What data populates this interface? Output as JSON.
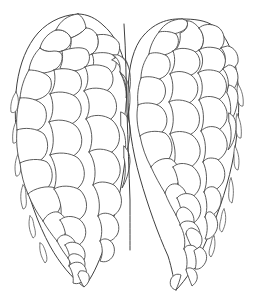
{
  "figure": {
    "style": "ink contour line art",
    "background_color": "#ffffff",
    "line_color": "#4a4a4a",
    "outline_color": "#3f3f3f",
    "fill_color": "#ffffff",
    "line_width": 0.9,
    "canvas": {
      "width": 260,
      "height": 300
    }
  },
  "composition": {
    "lobe_count": 2,
    "arrangement": "side-by-side twin lobes joined along a vertical central cleft",
    "lobes": [
      {
        "id": "left-lobe",
        "name": "left cone lobe",
        "bounds": {
          "x": 14,
          "y": 13,
          "width": 118,
          "height": 275
        },
        "apex": {
          "x": 78,
          "y": 14
        },
        "tip": {
          "x": 84,
          "y": 287
        },
        "scale_rows": 13,
        "scale_size_top": 30,
        "scale_size_bottom": 11
      },
      {
        "id": "right-lobe",
        "name": "right cone lobe",
        "bounds": {
          "x": 126,
          "y": 18,
          "width": 118,
          "height": 275
        },
        "apex": {
          "x": 182,
          "y": 19
        },
        "tip": {
          "x": 176,
          "y": 290
        },
        "scale_rows": 13,
        "scale_size_top": 30,
        "scale_size_bottom": 11
      }
    ],
    "cleft": {
      "name": "central cleft",
      "top": {
        "x": 124,
        "y": 24
      },
      "bottom": {
        "x": 130,
        "y": 250
      },
      "notch_depth": 60
    }
  },
  "chart_data": {
    "type": "line",
    "xlabel": "",
    "ylabel": "",
    "grid": false,
    "legend": "none",
    "xlim": [
      0,
      260
    ],
    "ylim": [
      0,
      300
    ],
    "series": [
      {
        "name": "left-lobe-outline",
        "points": "M 78 14 C 60 15 44 24 34 38 C 24 52 18 70 16 92 C 14 116 16 142 22 168 C 28 196 38 224 50 246 C 60 264 72 278 84 287 C 92 278 98 264 104 248 C 112 226 120 198 124 168 C 128 140 130 112 128 86 C 126 60 118 38 104 26 C 96 18 87 14 78 14 Z"
      },
      {
        "name": "right-lobe-outline",
        "points": "M 182 19 C 164 18 150 26 140 40 C 131 54 128 74 128 96 C 128 122 132 150 140 178 C 148 206 158 234 168 256 C 172 268 174 282 176 290 C 186 280 196 264 204 246 C 216 220 226 192 232 164 C 238 136 240 108 238 84 C 236 58 228 36 214 26 C 205 20 194 19 182 19 Z"
      },
      {
        "name": "central-cleft",
        "points": "M 124 24 C 126 52 126 82 127 112 C 128 142 129 172 130 200 C 130 222 130 238 130 250"
      }
    ]
  },
  "geometry": {
    "left_lobe_scales": [
      "M 56 30 C 48 33 42 40 40 48 C 45 52 54 53 62 51 C 68 49 72 44 71 38 C 68 32 62 29 56 30 Z",
      "M 78 14 C 68 15 60 21 56 30 C 62 29 68 32 71 38 C 76 36 82 33 86 28 C 85 21 82 16 78 14 Z",
      "M 86 28 C 82 33 76 36 71 38 C 72 44 70 50 66 55 C 74 58 84 58 92 54 C 98 50 100 42 97 35 C 94 30 90 28 86 28 Z",
      "M 97 35 C 100 42 98 50 92 54 C 96 60 104 62 112 60 C 118 57 121 50 119 43 C 115 36 106 33 97 35 Z",
      "M 40 48 C 34 54 30 62 29 70 C 36 74 46 74 54 70 C 60 67 63 61 62 55 C 61 52 58 51 54 51 C 48 52 43 51 40 48 Z",
      "M 62 51 C 63 55 63 62 60 68 C 68 72 78 72 85 67 C 90 63 91 55 87 50 C 82 46 70 48 62 51 Z",
      "M 92 54 C 95 60 94 68 89 73 C 96 77 105 77 111 73 C 117 69 118 60 113 55 C 108 52 99 52 92 54 Z",
      "M 112 60 C 118 62 122 68 121 75 C 126 76 128 72 128 66 C 127 59 122 56 117 57 Z",
      "M 29 70 C 24 78 21 88 20 98 C 27 102 38 101 45 96 C 51 92 53 84 50 78 C 45 72 36 70 29 70 Z",
      "M 54 70 C 56 78 55 88 50 94 C 58 99 70 99 77 93 C 83 88 83 78 77 72 C 70 68 60 68 54 70 Z",
      "M 85 67 C 89 74 89 84 84 91 C 92 96 103 95 109 89 C 115 83 114 73 108 68 C 101 64 91 64 85 67 Z",
      "M 113 55 C 118 58 121 64 120 72 C 124 80 127 90 126 98 C 130 94 131 84 130 74 C 129 64 124 57 118 55 Z",
      "M 20 98 C 17 108 16 120 17 130 C 24 134 34 133 41 128 C 47 123 48 113 44 106 C 38 99 27 97 20 98 Z",
      "M 50 94 C 54 102 54 114 49 122 C 57 128 69 127 76 121 C 83 115 83 104 76 97 C 68 91 56 91 50 94 Z",
      "M 84 91 C 90 98 91 110 86 119 C 95 125 107 124 113 117 C 119 110 117 98 110 92 C 102 87 90 87 84 91 Z",
      "M 120 72 C 126 80 128 92 126 104 C 126 112 124 120 121 126 C 127 122 130 110 130 98 C 130 86 127 77 120 72 Z",
      "M 17 130 C 16 141 17 153 20 163 C 27 166 37 164 43 158 C 49 152 49 141 44 134 C 37 128 24 127 17 130 Z",
      "M 49 122 C 54 131 55 145 50 155 C 58 161 70 160 77 153 C 84 146 83 133 76 126 C 68 119 56 119 49 122 Z",
      "M 86 119 C 92 127 94 141 89 152 C 98 158 110 156 116 148 C 122 140 120 127 112 120 C 104 114 92 114 86 119 Z",
      "M 121 126 C 126 134 127 146 124 158 C 127 152 130 141 130 130 C 130 120 127 114 121 112 Z",
      "M 20 163 C 21 174 24 185 28 194 C 35 195 44 192 49 186 C 54 179 53 168 47 162 C 40 158 27 159 20 163 Z",
      "M 50 155 C 56 164 58 178 54 189 C 62 195 74 193 80 186 C 87 178 85 165 78 158 C 70 152 57 152 50 155 Z",
      "M 89 152 C 95 160 97 174 93 185 C 101 190 112 188 117 180 C 123 172 120 160 113 153 C 105 148 95 148 89 152 Z",
      "M 124 158 C 126 166 126 178 122 188 C 126 182 129 172 130 162 C 130 154 128 150 124 146 Z",
      "M 28 194 C 32 204 37 213 43 221 C 49 220 56 216 59 210 C 63 203 61 193 55 188 C 48 185 34 188 28 194 Z",
      "M 54 189 C 60 197 63 210 60 220 C 67 225 77 223 83 216 C 89 209 87 197 80 190 C 72 185 60 185 54 189 Z",
      "M 93 185 C 99 193 101 206 98 216 C 105 220 115 217 119 210 C 124 202 121 191 114 185 C 106 181 98 181 93 185 Z",
      "M 43 221 C 47 228 52 235 57 241 C 62 239 66 234 67 228 C 68 221 64 215 58 212 C 52 211 46 215 43 221 Z",
      "M 60 220 C 65 227 67 237 65 245 C 71 249 79 247 83 241 C 88 234 86 224 79 219 C 72 215 64 216 60 220 Z",
      "M 98 216 C 102 223 103 233 100 241 C 106 244 113 241 117 235 C 121 228 118 219 112 215 C 106 212 101 213 98 216 Z",
      "M 57 241 C 60 247 64 253 68 258 C 72 256 75 252 76 247 C 76 241 72 237 67 235 C 62 234 58 237 57 241 Z",
      "M 65 245 C 69 251 71 259 69 266 C 74 269 80 267 83 262 C 87 256 85 248 79 244 C 73 241 68 242 65 245 Z",
      "M 100 241 C 103 247 103 255 100 261 C 105 263 110 261 113 256 C 116 250 114 243 109 240 C 105 238 102 239 100 241 Z",
      "M 68 258 C 71 264 74 270 78 275 C 82 273 85 269 85 264 C 85 259 81 255 76 254 C 72 253 69 255 68 258 Z",
      "M 69 266 C 72 271 74 277 73 283 C 78 285 83 282 85 278 C 88 272 86 266 81 263 C 76 261 71 263 69 266 Z",
      "M 78 275 C 80 280 82 284 84 287 C 88 284 90 280 89 276 C 88 272 84 270 80 271 Z"
    ],
    "right_lobe_scales": [
      "M 182 19 C 172 19 164 24 159 32 C 165 35 173 35 180 32 C 186 30 189 25 187 21 Z",
      "M 159 32 C 154 38 150 46 149 54 C 156 57 166 56 173 51 C 179 47 180 39 176 34 C 170 31 163 31 159 32 Z",
      "M 187 21 C 189 26 186 31 180 33 C 181 40 179 47 174 52 C 182 56 192 55 199 50 C 205 45 205 35 199 28 C 195 23 190 20 187 21 Z",
      "M 199 28 C 205 35 205 45 199 51 C 206 55 215 54 221 48 C 226 42 225 32 218 27 C 211 23 203 24 199 28 Z",
      "M 149 54 C 144 61 141 70 141 78 C 148 82 158 81 165 76 C 171 71 172 62 167 56 C 160 52 153 52 149 54 Z",
      "M 173 51 C 176 58 175 68 170 74 C 178 79 189 78 196 72 C 202 66 201 56 194 51 C 186 47 177 48 173 51 Z",
      "M 199 50 C 204 56 204 66 198 73 C 206 78 216 76 222 70 C 228 64 226 54 219 49 C 211 46 203 47 199 50 Z",
      "M 221 48 C 226 53 227 62 223 69 C 230 71 236 68 238 62 C 239 54 234 47 228 46 Z",
      "M 141 78 C 138 86 137 96 138 105 C 145 109 155 107 161 102 C 167 96 167 86 161 80 C 154 76 145 76 141 78 Z",
      "M 170 74 C 174 82 174 94 169 102 C 177 108 188 106 194 99 C 200 92 199 81 191 75 C 183 70 174 71 170 74 Z",
      "M 198 73 C 203 80 204 92 199 100 C 207 105 217 103 223 96 C 229 89 227 78 219 72 C 212 69 203 69 198 73 Z",
      "M 223 69 C 228 74 230 84 227 93 C 233 92 237 86 238 78 C 238 70 234 65 229 65 Z",
      "M 138 105 C 136 114 137 126 140 136 C 147 139 157 137 163 131 C 169 124 168 113 161 107 C 154 102 143 102 138 105 Z",
      "M 169 102 C 174 110 175 124 170 134 C 178 140 190 137 196 130 C 202 122 200 110 192 104 C 184 99 174 99 169 102 Z",
      "M 199 100 C 204 108 205 121 201 131 C 209 135 219 132 224 125 C 230 117 227 105 219 99 C 211 95 203 96 199 100 Z",
      "M 227 93 C 231 100 232 112 229 122 C 234 118 237 108 238 98 C 238 90 234 86 229 85 Z",
      "M 140 136 C 142 147 146 158 151 167 C 158 168 166 164 170 157 C 174 149 172 138 165 133 C 157 130 145 131 140 136 Z",
      "M 170 134 C 175 143 177 157 173 167 C 181 172 192 169 197 161 C 203 153 200 141 192 135 C 184 130 174 131 170 134 Z",
      "M 201 131 C 206 139 207 152 203 162 C 211 165 220 161 225 153 C 230 145 226 133 218 128 C 211 125 205 127 201 131 Z",
      "M 229 122 C 232 129 232 141 228 150 C 233 145 236 135 236 126 C 236 119 233 115 229 113 Z",
      "M 151 167 C 155 176 160 185 165 193 C 171 192 177 187 179 180 C 181 172 178 163 171 159 C 163 157 155 161 151 167 Z",
      "M 173 167 C 178 175 180 188 177 198 C 184 202 194 198 198 191 C 203 183 200 172 192 166 C 184 162 177 163 173 167 Z",
      "M 203 162 C 207 170 208 182 204 192 C 211 194 219 189 223 182 C 227 174 224 164 217 159 C 210 157 206 158 203 162 Z",
      "M 165 193 C 168 201 172 208 176 215 C 182 213 186 208 187 202 C 188 194 184 187 177 184 C 170 183 167 187 165 193 Z",
      "M 177 198 C 181 206 183 216 180 225 C 187 228 195 224 199 217 C 203 210 200 200 193 195 C 186 192 180 194 177 198 Z",
      "M 204 192 C 207 199 208 209 205 217 C 211 218 217 213 220 206 C 223 198 220 190 214 187 C 209 186 206 188 204 192 Z",
      "M 176 215 C 179 222 182 228 186 234 C 191 232 194 227 194 221 C 194 214 190 209 184 207 C 179 207 177 211 176 215 Z",
      "M 180 225 C 184 232 186 241 184 249 C 190 251 196 247 199 241 C 202 234 199 226 193 222 C 187 220 182 221 180 225 Z",
      "M 205 217 C 208 223 208 232 205 239 C 210 240 215 235 217 229 C 219 222 216 215 211 212 C 207 211 206 214 205 217 Z",
      "M 186 234 C 188 240 191 246 194 251 C 199 249 202 245 202 240 C 202 234 198 230 192 228 C 188 228 186 231 186 234 Z",
      "M 184 249 C 187 255 188 263 186 270 C 191 272 197 268 199 263 C 202 256 199 249 194 246 C 189 244 185 246 184 249 Z",
      "M 194 251 C 196 257 197 263 195 269 C 200 270 204 266 206 261 C 208 255 205 249 200 247 Z",
      "M 186 270 C 188 276 190 281 192 286 C 196 283 198 279 197 275 C 196 270 192 267 188 268 Z",
      "M 176 290 C 178 285 180 280 181 275 C 177 273 173 275 171 279 C 169 284 171 289 176 290 Z"
    ],
    "left_edge_tips": [
      "M 16 92 C 12 97 10 105 11 112 C 14 114 17 111 18 106 C 19 100 18 95 16 92 Z",
      "M 17 120 C 13 126 12 135 13 143 C 16 144 18 140 19 134 C 20 127 19 122 17 120 Z",
      "M 19 152 C 15 159 14 168 16 176 C 19 177 21 172 21 166 C 21 158 21 154 19 152 Z",
      "M 23 185 C 20 192 20 201 23 209 C 26 209 27 204 26 197 C 26 190 25 186 23 185 Z",
      "M 30 216 C 28 223 29 231 33 238 C 36 237 36 232 34 226 C 33 219 32 217 30 216 Z",
      "M 40 243 C 39 250 41 257 45 263 C 48 261 47 256 45 250 C 43 245 42 243 40 243 Z"
    ],
    "right_edge_tips": [
      "M 238 84 C 242 90 244 98 243 106 C 240 107 238 103 237 97 C 237 90 237 86 238 84 Z",
      "M 237 114 C 241 121 242 130 241 138 C 238 139 236 134 236 128 C 236 120 236 116 237 114 Z",
      "M 235 146 C 239 153 240 162 238 170 C 235 170 234 165 234 159 C 234 151 234 147 235 146 Z",
      "M 231 178 C 234 186 234 195 232 203 C 229 202 228 197 229 190 C 229 183 230 179 231 178 Z",
      "M 224 209 C 227 216 226 225 222 232 C 219 231 219 226 221 219 C 222 212 223 210 224 209 Z",
      "M 214 236 C 216 243 215 251 211 257 C 208 255 209 250 211 244 C 212 238 213 236 214 236 Z"
    ]
  }
}
